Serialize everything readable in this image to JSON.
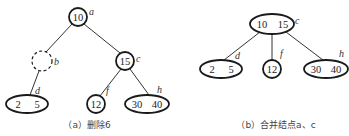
{
  "diagram_a": {
    "caption": "（a）删除6",
    "nodes": {
      "a": {
        "label": "a",
        "keys": [
          "10"
        ]
      },
      "b": {
        "label": "b",
        "keys": [],
        "style": "dashed"
      },
      "c": {
        "label": "c",
        "keys": [
          "15"
        ]
      },
      "d": {
        "label": "d",
        "keys": [
          "2",
          "5"
        ]
      },
      "f": {
        "label": "f",
        "keys": [
          "12"
        ]
      },
      "h": {
        "label": "h",
        "keys": [
          "30",
          "40"
        ]
      }
    },
    "edges": [
      [
        "a",
        "b"
      ],
      [
        "a",
        "c"
      ],
      [
        "b",
        "d"
      ],
      [
        "c",
        "f"
      ],
      [
        "c",
        "h"
      ]
    ]
  },
  "diagram_b": {
    "caption": "（b）合并结点a、c",
    "nodes": {
      "c": {
        "label": "c",
        "keys": [
          "10",
          "15"
        ]
      },
      "d": {
        "label": "d",
        "keys": [
          "2",
          "5"
        ]
      },
      "f": {
        "label": "f",
        "keys": [
          "12"
        ]
      },
      "h": {
        "label": "h",
        "keys": [
          "30",
          "40"
        ]
      }
    },
    "edges": [
      [
        "c",
        "d"
      ],
      [
        "c",
        "f"
      ],
      [
        "c",
        "h"
      ]
    ]
  }
}
